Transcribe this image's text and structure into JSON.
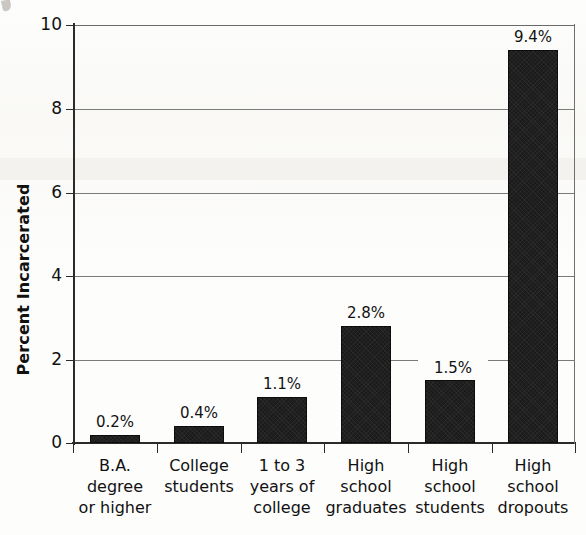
{
  "chart_data": {
    "type": "bar",
    "title": "",
    "subtitle": "",
    "xlabel": "",
    "ylabel": "Percent Incarcerated",
    "ylim": [
      0,
      10
    ],
    "yticks": [
      0,
      2,
      4,
      6,
      8,
      10
    ],
    "ytick_labels": [
      "0",
      "2",
      "4",
      "6",
      "8",
      "10"
    ],
    "grid": "horizontal",
    "legend": "none",
    "bar_color": "#1b1b1b",
    "categories": [
      "B.A. degree or higher",
      "College students",
      "1 to 3 years of college",
      "High school graduates",
      "High school students",
      "High school dropouts"
    ],
    "category_lines": [
      [
        "B.A.",
        "degree",
        "or higher"
      ],
      [
        "College",
        "students"
      ],
      [
        "1 to 3",
        "years of",
        "college"
      ],
      [
        "High",
        "school",
        "graduates"
      ],
      [
        "High",
        "school",
        "students"
      ],
      [
        "High",
        "school",
        "dropouts"
      ]
    ],
    "values": [
      0.2,
      0.4,
      1.1,
      2.8,
      1.5,
      9.4
    ],
    "data_labels": [
      "0.2%",
      "0.4%",
      "1.1%",
      "2.8%",
      "1.5%",
      "9.4%"
    ]
  },
  "axis": {
    "y_title": "Percent Incarcerated",
    "tick_0": "0",
    "tick_2": "2",
    "tick_4": "4",
    "tick_6": "6",
    "tick_8": "8",
    "tick_10": "10"
  },
  "bars": [
    {
      "label": "0.2%",
      "cat_l1": "B.A.",
      "cat_l2": "degree",
      "cat_l3": "or higher"
    },
    {
      "label": "0.4%",
      "cat_l1": "College",
      "cat_l2": "students",
      "cat_l3": ""
    },
    {
      "label": "1.1%",
      "cat_l1": "1 to 3",
      "cat_l2": "years of",
      "cat_l3": "college"
    },
    {
      "label": "2.8%",
      "cat_l1": "High",
      "cat_l2": "school",
      "cat_l3": "graduates"
    },
    {
      "label": "1.5%",
      "cat_l1": "High",
      "cat_l2": "school",
      "cat_l3": "students"
    },
    {
      "label": "9.4%",
      "cat_l1": "High",
      "cat_l2": "school",
      "cat_l3": "dropouts"
    }
  ]
}
